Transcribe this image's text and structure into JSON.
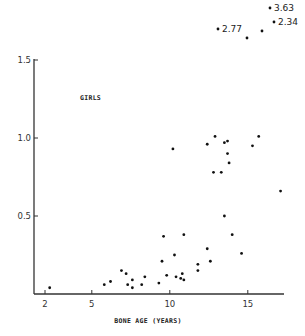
{
  "chart_data": {
    "type": "scatter",
    "title": "",
    "series_label": "GIRLS",
    "xlabel": "BONE AGE (YEARS)",
    "ylabel": "",
    "xlim": [
      2,
      17.5
    ],
    "ylim": [
      0,
      1.5
    ],
    "x_ticks": [
      2,
      5,
      10,
      15
    ],
    "x_tick_labels": [
      "2",
      "5",
      "10",
      "15"
    ],
    "y_ticks": [
      0.5,
      1.0,
      1.5
    ],
    "y_tick_labels": [
      "0.5",
      "1.0",
      "1.5"
    ],
    "grid": false,
    "legend": "none",
    "points": [
      {
        "x": 2.3,
        "y": 0.04
      },
      {
        "x": 5.8,
        "y": 0.06
      },
      {
        "x": 6.2,
        "y": 0.08
      },
      {
        "x": 6.9,
        "y": 0.15
      },
      {
        "x": 7.2,
        "y": 0.13
      },
      {
        "x": 7.6,
        "y": 0.09
      },
      {
        "x": 7.6,
        "y": 0.04
      },
      {
        "x": 7.3,
        "y": 0.06
      },
      {
        "x": 8.4,
        "y": 0.11
      },
      {
        "x": 8.2,
        "y": 0.06
      },
      {
        "x": 9.3,
        "y": 0.07
      },
      {
        "x": 9.6,
        "y": 0.37
      },
      {
        "x": 9.5,
        "y": 0.21
      },
      {
        "x": 9.8,
        "y": 0.12
      },
      {
        "x": 10.4,
        "y": 0.11
      },
      {
        "x": 10.7,
        "y": 0.1
      },
      {
        "x": 10.9,
        "y": 0.09
      },
      {
        "x": 10.8,
        "y": 0.13
      },
      {
        "x": 10.3,
        "y": 0.25
      },
      {
        "x": 10.9,
        "y": 0.38
      },
      {
        "x": 10.2,
        "y": 0.93
      },
      {
        "x": 11.8,
        "y": 0.19
      },
      {
        "x": 11.8,
        "y": 0.15
      },
      {
        "x": 12.4,
        "y": 0.29
      },
      {
        "x": 12.6,
        "y": 0.21
      },
      {
        "x": 13.5,
        "y": 0.5
      },
      {
        "x": 14.0,
        "y": 0.38
      },
      {
        "x": 14.6,
        "y": 0.26
      },
      {
        "x": 12.4,
        "y": 0.96
      },
      {
        "x": 12.9,
        "y": 1.01
      },
      {
        "x": 12.8,
        "y": 0.78
      },
      {
        "x": 13.3,
        "y": 0.78
      },
      {
        "x": 13.5,
        "y": 0.97
      },
      {
        "x": 13.7,
        "y": 0.98
      },
      {
        "x": 13.7,
        "y": 0.9
      },
      {
        "x": 13.8,
        "y": 0.84
      },
      {
        "x": 15.3,
        "y": 0.95
      },
      {
        "x": 15.7,
        "y": 1.01
      },
      {
        "x": 17.1,
        "y": 0.66
      }
    ],
    "off_scale_points": [
      {
        "x": 13.1,
        "y": 2.77,
        "label": "2.77",
        "px": 218,
        "py": 29
      },
      {
        "x": 14.9,
        "y": null,
        "label": "",
        "px": 247,
        "py": 38
      },
      {
        "x": 15.9,
        "y": null,
        "label": "",
        "px": 262,
        "py": 31
      },
      {
        "x": 16.4,
        "y": 3.63,
        "label": "3.63",
        "px": 270,
        "py": 8
      },
      {
        "x": 16.7,
        "y": 2.34,
        "label": "2.34",
        "px": 274,
        "py": 22
      }
    ]
  }
}
